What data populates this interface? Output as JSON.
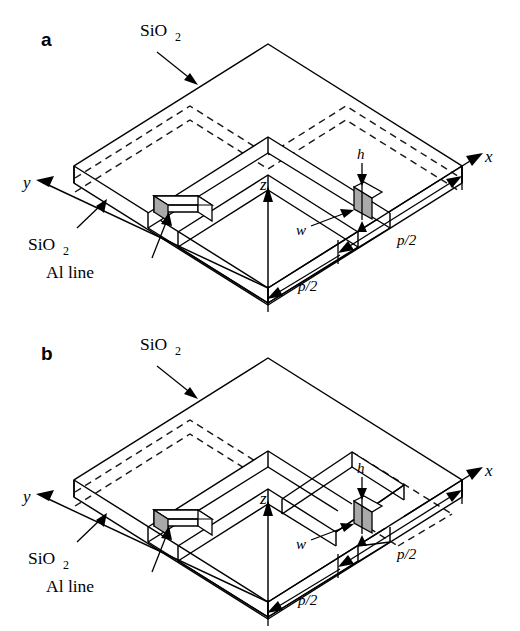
{
  "figure": {
    "background_color": "#ffffff",
    "line_color": "#000000",
    "al_fill_color": "#a9a9a9",
    "oxide_fill_color": "#ffffff",
    "caption_note": "Isometric schematic of SiO2 passivation over Al interconnect lines"
  },
  "panels": [
    {
      "id": "a",
      "label": "a",
      "labels": {
        "oxide_top": "SiO",
        "oxide_top_sub": "2",
        "oxide_side": "SiO",
        "oxide_side_sub": "2",
        "al_line": "Al line"
      },
      "axes": {
        "x": "x",
        "y": "y",
        "z": "z"
      },
      "dimensions": {
        "height": "h",
        "width": "w",
        "pitch_right": "p/2",
        "pitch_front": "p/2"
      }
    },
    {
      "id": "b",
      "label": "b",
      "labels": {
        "oxide_top": "SiO",
        "oxide_top_sub": "2",
        "oxide_side": "SiO",
        "oxide_side_sub": "2",
        "al_line": "Al line"
      },
      "axes": {
        "x": "x",
        "y": "y",
        "z": "z"
      },
      "dimensions": {
        "height": "h",
        "width": "w",
        "pitch_right": "p/2",
        "pitch_front": "p/2"
      }
    }
  ]
}
